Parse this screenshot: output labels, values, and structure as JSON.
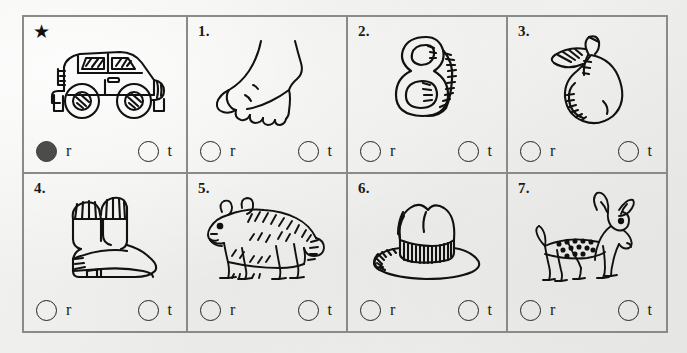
{
  "worksheet": {
    "title": "Rhyming / beginning-sound multiple choice worksheet",
    "paper_color": "#eeeeec",
    "border_color": "#8a8a88",
    "ink_color": "#1a1a1a",
    "filled_bubble_color": "#4c4c4a",
    "options": {
      "left_letter": "r",
      "right_letter": "t"
    },
    "cells": [
      {
        "label": "★",
        "label_kind": "star",
        "picture": "car",
        "choices": [
          {
            "letter": "r",
            "filled": true
          },
          {
            "letter": "t",
            "filled": false
          }
        ]
      },
      {
        "label": "1.",
        "label_kind": "number",
        "picture": "foot",
        "choices": [
          {
            "letter": "r",
            "filled": false
          },
          {
            "letter": "t",
            "filled": false
          }
        ]
      },
      {
        "label": "2.",
        "label_kind": "number",
        "picture": "eight",
        "choices": [
          {
            "letter": "r",
            "filled": false
          },
          {
            "letter": "t",
            "filled": false
          }
        ]
      },
      {
        "label": "3.",
        "label_kind": "number",
        "picture": "pear",
        "choices": [
          {
            "letter": "r",
            "filled": false
          },
          {
            "letter": "t",
            "filled": false
          }
        ]
      },
      {
        "label": "4.",
        "label_kind": "number",
        "picture": "boot",
        "choices": [
          {
            "letter": "r",
            "filled": false
          },
          {
            "letter": "t",
            "filled": false
          }
        ]
      },
      {
        "label": "5.",
        "label_kind": "number",
        "picture": "bear",
        "choices": [
          {
            "letter": "r",
            "filled": false
          },
          {
            "letter": "t",
            "filled": false
          }
        ]
      },
      {
        "label": "6.",
        "label_kind": "number",
        "picture": "hat",
        "choices": [
          {
            "letter": "r",
            "filled": false
          },
          {
            "letter": "t",
            "filled": false
          }
        ]
      },
      {
        "label": "7.",
        "label_kind": "number",
        "picture": "deer",
        "choices": [
          {
            "letter": "r",
            "filled": false
          },
          {
            "letter": "t",
            "filled": false
          }
        ]
      }
    ]
  }
}
